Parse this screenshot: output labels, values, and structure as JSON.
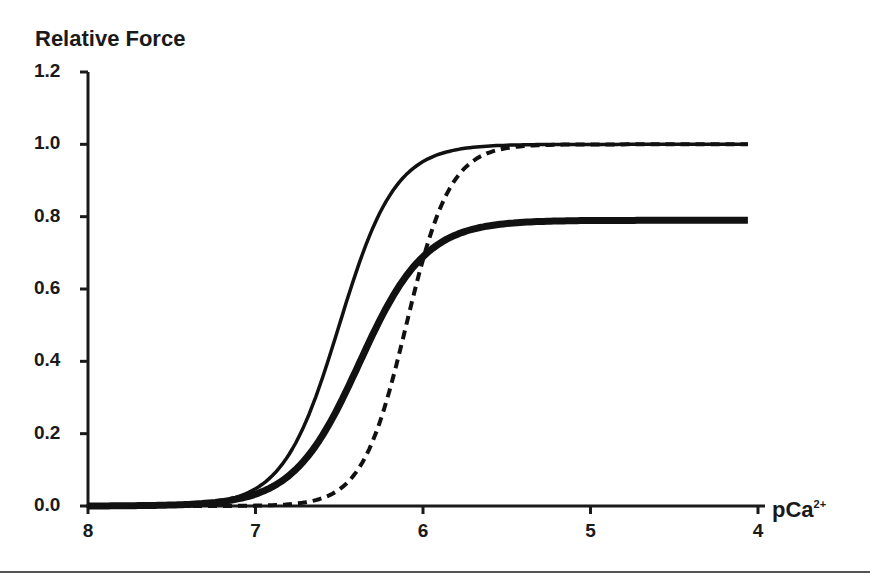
{
  "chart_data": {
    "type": "line",
    "title": "",
    "ylabel": "Relative Force",
    "xlabel": "pCa2+",
    "xlabel_main": "pCa",
    "xlabel_sup": "2+",
    "xlim": [
      8,
      4
    ],
    "ylim": [
      0.0,
      1.2
    ],
    "x_ticks": [
      "8",
      "7",
      "6",
      "5",
      "4"
    ],
    "y_ticks": [
      "1.2",
      "1.0",
      "0.8",
      "0.6",
      "0.4",
      "0.2",
      "0.0"
    ],
    "grid": false,
    "legend": null,
    "x": [
      8.0,
      7.5,
      7.25,
      7.0,
      6.9,
      6.8,
      6.7,
      6.6,
      6.5,
      6.4,
      6.3,
      6.2,
      6.1,
      6.0,
      5.9,
      5.8,
      5.6,
      5.4,
      5.0,
      4.5,
      4.0
    ],
    "series": [
      {
        "name": "thin solid",
        "style": "solid-thin",
        "pCa50": 6.5,
        "hill": 2.6,
        "max": 1.0,
        "values": [
          0.0,
          0.01,
          0.02,
          0.05,
          0.08,
          0.14,
          0.23,
          0.36,
          0.5,
          0.64,
          0.77,
          0.86,
          0.92,
          0.95,
          0.97,
          0.98,
          0.99,
          1.0,
          1.0,
          1.0,
          1.0
        ]
      },
      {
        "name": "thick solid",
        "style": "solid-thick",
        "pCa50": 6.38,
        "hill": 2.2,
        "max": 0.79,
        "values": [
          0.0,
          0.01,
          0.02,
          0.05,
          0.08,
          0.12,
          0.18,
          0.26,
          0.34,
          0.43,
          0.52,
          0.6,
          0.66,
          0.71,
          0.74,
          0.76,
          0.78,
          0.79,
          0.79,
          0.79,
          0.79
        ]
      },
      {
        "name": "dashed",
        "style": "dashed",
        "pCa50": 6.1,
        "hill": 3.3,
        "max": 1.0,
        "values": [
          0.0,
          0.0,
          0.01,
          0.01,
          0.02,
          0.03,
          0.05,
          0.08,
          0.13,
          0.2,
          0.3,
          0.42,
          0.55,
          0.68,
          0.8,
          0.88,
          0.96,
          0.99,
          1.0,
          1.0,
          1.0
        ]
      }
    ]
  }
}
